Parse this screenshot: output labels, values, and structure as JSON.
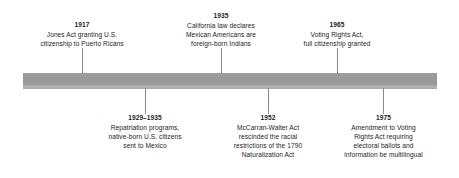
{
  "figure": {
    "type": "horizontal-timeline",
    "background_color": "#ffffff",
    "bar_color": "#9a9a9a",
    "text_color": "#1d1d1d"
  },
  "events_above": [
    {
      "year": "1917",
      "description": "Jones Act granting U.S.\ncitizenship to Puerto Ricans"
    },
    {
      "year": "1935",
      "description": "California law declares\nMexican Americans are\nforeign-born Indians"
    },
    {
      "year": "1965",
      "description": "Voting Rights Act,\nfull citizenship granted"
    }
  ],
  "events_below": [
    {
      "year": "1929–1935",
      "description": "Repatriation programs,\nnative-born U.S. citizens\nsent to Mexico"
    },
    {
      "year": "1952",
      "description": "McCarran-Walter Act\nrescinded the racial\nrestrictions of the 1790\nNaturalization Act"
    },
    {
      "year": "1975",
      "description": "Amendment to Voting\nRights Act requiring\nelectoral ballots and\ninformation be multilingual"
    }
  ]
}
